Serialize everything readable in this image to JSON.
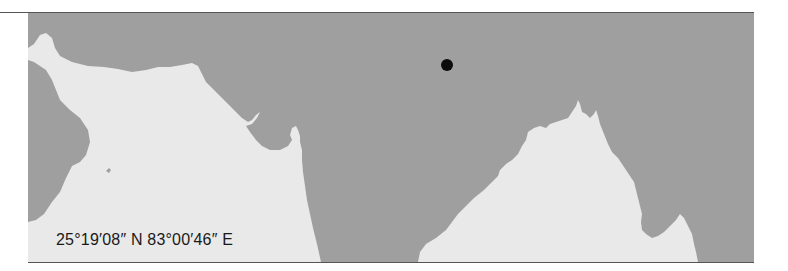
{
  "map": {
    "region": "South Asia (Indian subcontinent)",
    "coordinates_label": "25°19′08″ N 83°00′46″ E",
    "marker": {
      "type": "location-dot",
      "color": "#0c0c0c"
    },
    "colors": {
      "land": "#9f9f9f",
      "sea": "#e9e9e9",
      "frame_rule": "#555555",
      "label_text": "#1a1a1a"
    },
    "water_bodies": [
      "Arabian Sea",
      "Bay of Bengal"
    ]
  }
}
